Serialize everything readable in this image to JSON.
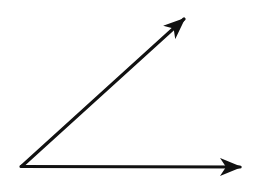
{
  "diagram": {
    "type": "angle",
    "description": "An acute angle formed by two rays sharing a common vertex",
    "background": "#ffffff",
    "stroke_color": "#111111",
    "vertex": {
      "x": 22,
      "y": 166
    },
    "rays": [
      {
        "name": "oblique-ray",
        "from": {
          "x": 22,
          "y": 166
        },
        "to": {
          "x": 184,
          "y": 19
        }
      },
      {
        "name": "horizontal-ray",
        "from": {
          "x": 22,
          "y": 166
        },
        "to": {
          "x": 240,
          "y": 167
        }
      }
    ]
  }
}
